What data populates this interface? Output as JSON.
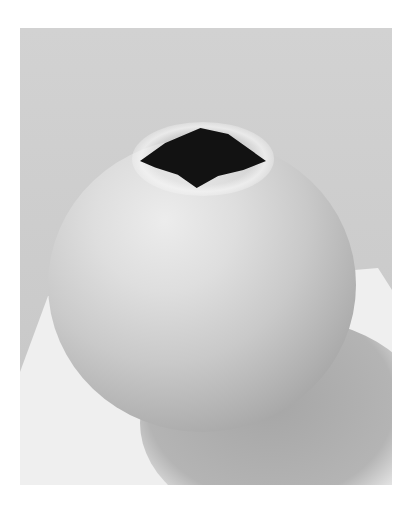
{
  "image": {
    "description": "Black and white photograph of a round spherical vessel with an irregular opening at the top, resting on a white surface against a light gray background",
    "colors": {
      "background": "#cbcbcb",
      "surface": "#efefef",
      "vessel_highlight": "#ececec",
      "vessel_shadow": "#8f8f8f",
      "opening": "#121212",
      "page": "#ffffff"
    }
  }
}
